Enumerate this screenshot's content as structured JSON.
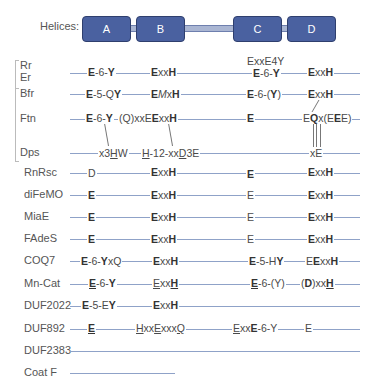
{
  "helices": {
    "label": "Helices:",
    "items": [
      {
        "name": "A",
        "color": "#4a61a0"
      },
      {
        "name": "B",
        "color": "#4a61a0"
      },
      {
        "name": "C",
        "color": "#4a61a0"
      },
      {
        "name": "D",
        "color": "#4a61a0"
      }
    ]
  },
  "groups": [
    {
      "rows": [
        "Rr",
        "Er"
      ]
    },
    {
      "rows": [
        "Bfr",
        "Ftn",
        "Dps"
      ]
    }
  ],
  "rows": [
    {
      "label": "Rr",
      "motifs": []
    },
    {
      "label": "Er",
      "motifs": [
        "E-6-Y",
        "ExxH",
        "ExxE4Y / E-6-Y",
        "ExxH"
      ],
      "note": "ExxE4Y"
    },
    {
      "label": "Bfr",
      "motifs": [
        "E-5-QY",
        "EMxH",
        "E-6-(Y)",
        "ExxH"
      ]
    },
    {
      "label": "Ftn",
      "motifs": [
        "E-6-Y",
        "(Q)xxEExxH",
        "E",
        "EQx(EEE)"
      ]
    },
    {
      "label": "Dps",
      "motifs": [
        "x3HW",
        "H-12-xxD3E",
        "xE"
      ]
    },
    {
      "label": "RnRsc",
      "motifs": [
        "D",
        "ExxH",
        "E",
        "ExxH"
      ]
    },
    {
      "label": "diFeMO",
      "motifs": [
        "E",
        "ExxH",
        "E",
        "ExxH"
      ]
    },
    {
      "label": "MiaE",
      "motifs": [
        "E",
        "ExxH",
        "E",
        "ExxH"
      ]
    },
    {
      "label": "FAdeS",
      "motifs": [
        "E",
        "ExxH",
        "E",
        "ExxH"
      ]
    },
    {
      "label": "COQ7",
      "motifs": [
        "E-6-YxQ",
        "ExxH",
        "E-5-HY",
        "EExxH"
      ]
    },
    {
      "label": "Mn-Cat",
      "motifs": [
        "E-6-Y",
        "ExxH",
        "E-6-(Y)",
        "(D)xxH"
      ]
    },
    {
      "label": "DUF2022",
      "motifs": [
        "E-5-EY",
        "ExxH"
      ]
    },
    {
      "label": "DUF892",
      "motifs": [
        "E",
        "HxxExxxQ",
        "ExxE-6-Y",
        "E"
      ]
    },
    {
      "label": "DUF2383",
      "motifs": []
    },
    {
      "label": "Coat F",
      "motifs": []
    }
  ],
  "labels": {
    "rr": "Rr",
    "er": "Er",
    "bfr": "Bfr",
    "ftn": "Ftn",
    "dps": "Dps",
    "rnrsc": "RnRsc",
    "difemo": "diFeMO",
    "miae": "MiaE",
    "fades": "FAdeS",
    "coq7": "COQ7",
    "mncat": "Mn-Cat",
    "duf2022": "DUF2022",
    "duf892": "DUF892",
    "duf2383": "DUF2383",
    "coatf": "Coat F"
  },
  "colors": {
    "helix_fill": "#4a61a0",
    "helix_border": "#2f3f6e",
    "line": "#8fa2c8",
    "link": "#aab6d3"
  }
}
